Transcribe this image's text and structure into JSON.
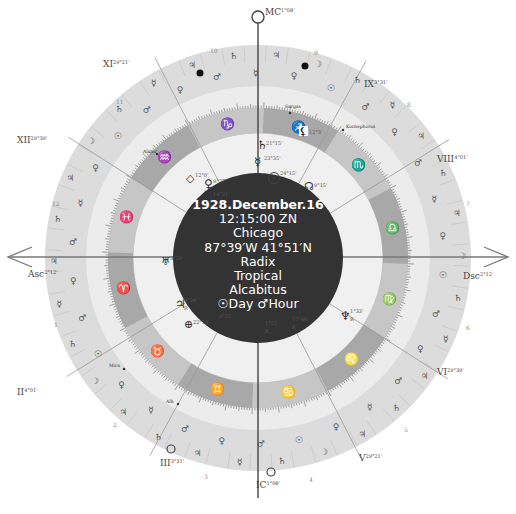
{
  "chart_info": {
    "date": "1928.December.16",
    "time": "12:15:00 ZN",
    "place": "Chicago",
    "coordinates": "87°39′W 41°51′N",
    "chart_type": "Radix",
    "zodiac": "Tropical",
    "house_system": "Alcabitus",
    "day_hour": "☉Day ♂Hour"
  },
  "angles": {
    "asc": {
      "label": "Asc",
      "degree": "2°12'"
    },
    "dsc": {
      "label": "Dsc",
      "degree": "2°12'"
    },
    "mc": {
      "label": "MC",
      "degree": "1°08'"
    },
    "ic": {
      "label": "IC",
      "degree": "1°08'"
    }
  },
  "house_cusps": [
    {
      "label": "XI",
      "degree": "29°21'"
    },
    {
      "label": "XII",
      "degree": "29°39'"
    },
    {
      "label": "II",
      "degree": "4°01'"
    },
    {
      "label": "III",
      "degree": "3°31'"
    },
    {
      "label": "V",
      "degree": "29°21'"
    },
    {
      "label": "VI",
      "degree": "29°39'"
    },
    {
      "label": "VIII",
      "degree": "4°01'"
    },
    {
      "label": "IX",
      "degree": "3°31'"
    }
  ],
  "house_numbers": [
    "1",
    "2",
    "3",
    "4",
    "5",
    "6",
    "7",
    "8",
    "9",
    "10",
    "11",
    "12"
  ],
  "signs": [
    {
      "name": "aries",
      "glyph": "♈"
    },
    {
      "name": "taurus",
      "glyph": "♉"
    },
    {
      "name": "gemini",
      "glyph": "♊"
    },
    {
      "name": "cancer",
      "glyph": "♋"
    },
    {
      "name": "leo",
      "glyph": "♌"
    },
    {
      "name": "virgo",
      "glyph": "♍"
    },
    {
      "name": "libra",
      "glyph": "♎"
    },
    {
      "name": "scorpio",
      "glyph": "♏"
    },
    {
      "name": "sagittarius",
      "glyph": "♐"
    },
    {
      "name": "capricorn",
      "glyph": "♑"
    },
    {
      "name": "aquarius",
      "glyph": "♒"
    },
    {
      "name": "pisces",
      "glyph": "♓"
    }
  ],
  "planets": [
    {
      "name": "sun",
      "glyph": "☉",
      "degree": "24°15'"
    },
    {
      "name": "moon",
      "glyph": "☽",
      "degree": "14°31'"
    },
    {
      "name": "mercury",
      "glyph": "☿",
      "degree": "23°35'"
    },
    {
      "name": "venus",
      "glyph": "♀",
      "degree": "9°37'"
    },
    {
      "name": "mars",
      "glyph": "♂",
      "degree": "1°22'",
      "retro": "R"
    },
    {
      "name": "jupiter",
      "glyph": "♃",
      "degree": "3°34'",
      "retro": "R"
    },
    {
      "name": "saturn",
      "glyph": "♄",
      "degree": "21°15'"
    },
    {
      "name": "uranus",
      "glyph": "♅",
      "degree": "3°29'"
    },
    {
      "name": "neptune",
      "glyph": "♆",
      "degree": "1°33'",
      "retro": "R"
    },
    {
      "name": "pluto",
      "glyph": "♇",
      "degree": "17°46'",
      "retro": "R"
    },
    {
      "name": "node",
      "glyph": "☊",
      "degree": "9°15'"
    },
    {
      "name": "fortune",
      "glyph": "⊕",
      "degree": "22°18'"
    },
    {
      "name": "lilith",
      "glyph": "⚸",
      "degree": "12°3'"
    },
    {
      "name": "vertex",
      "glyph": "◇",
      "degree": "12°0'"
    },
    {
      "name": "south-node",
      "glyph": "☋",
      "degree": "9°15'"
    }
  ],
  "fixed_stars": [
    "Sargas",
    "Kornephoros",
    "Alnair",
    "Mira",
    "Alh"
  ],
  "colors": {
    "outer_ring": "#dcdcdc",
    "middle_band": "#ececec",
    "zodiac_band_dark": "#a9a9a9",
    "zodiac_band_light": "#c8c8c8",
    "inner_area": "#efefef",
    "center_disc": "#333333",
    "line": "#6e6e6e"
  }
}
